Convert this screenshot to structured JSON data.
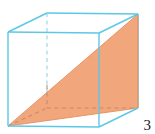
{
  "figure": {
    "label": "cube-with-diagonal-cross-section",
    "page_number": "3",
    "colors": {
      "edge": "#5bc8e8",
      "hidden_edge": "#9fd8ea",
      "triangle_fill": "#f0a175",
      "triangle_edge": "#e08a5c",
      "page_number": "#1a1a1a",
      "background": "#ffffff"
    },
    "geometry": {
      "front_face": {
        "top_left": [
          8,
          32
        ],
        "top_right": [
          99,
          33
        ],
        "bottom_right": [
          99,
          127
        ],
        "bottom_left": [
          8,
          126
        ]
      },
      "back_face": {
        "top_left": [
          47,
          13
        ],
        "top_right": [
          138,
          14
        ],
        "bottom_right": [
          138,
          108
        ],
        "bottom_left": [
          47,
          108
        ]
      },
      "triangle": {
        "vertices": [
          [
            8,
            126
          ],
          [
            138,
            14
          ],
          [
            138,
            108
          ]
        ],
        "description": "diagonal cross-section plane through the cube"
      },
      "hidden_edges": [
        [
          [
            47,
            13
          ],
          [
            47,
            108
          ]
        ],
        [
          [
            47,
            108
          ],
          [
            138,
            108
          ]
        ],
        [
          [
            8,
            126
          ],
          [
            47,
            108
          ]
        ]
      ]
    }
  }
}
